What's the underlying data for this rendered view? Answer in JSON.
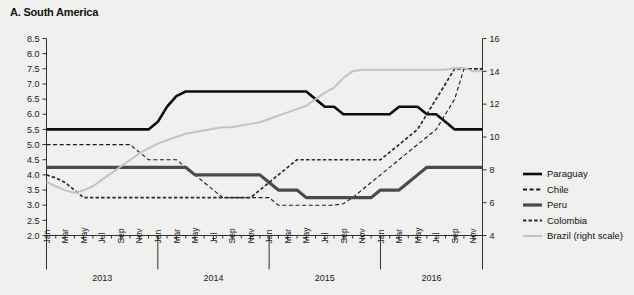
{
  "panel": {
    "title": "A. South America"
  },
  "chart_data": {
    "type": "line",
    "title": "A. South America",
    "xlabel": "",
    "ylabel": "",
    "y2label": "",
    "ylim": [
      2.0,
      8.5
    ],
    "y2lim": [
      4,
      16
    ],
    "grid": false,
    "legend_position": "right",
    "y_ticks": [
      "8.5",
      "8.0",
      "7.5",
      "7.0",
      "6.5",
      "6.0",
      "5.5",
      "5.0",
      "4.5",
      "4.0",
      "3.5",
      "3.0",
      "2.5",
      "2.0"
    ],
    "y2_ticks": [
      "16",
      "14",
      "12",
      "10",
      "8",
      "6",
      "4"
    ],
    "x_month_ticks": [
      "Jan",
      "Mar",
      "May",
      "Jul",
      "Sep",
      "Nov"
    ],
    "x_years": [
      "2013",
      "2014",
      "2015",
      "2016"
    ],
    "x": [
      "2013-01",
      "2013-02",
      "2013-03",
      "2013-04",
      "2013-05",
      "2013-06",
      "2013-07",
      "2013-08",
      "2013-09",
      "2013-10",
      "2013-11",
      "2013-12",
      "2014-01",
      "2014-02",
      "2014-03",
      "2014-04",
      "2014-05",
      "2014-06",
      "2014-07",
      "2014-08",
      "2014-09",
      "2014-10",
      "2014-11",
      "2014-12",
      "2015-01",
      "2015-02",
      "2015-03",
      "2015-04",
      "2015-05",
      "2015-06",
      "2015-07",
      "2015-08",
      "2015-09",
      "2015-10",
      "2015-11",
      "2015-12",
      "2016-01",
      "2016-02",
      "2016-03",
      "2016-04",
      "2016-05",
      "2016-06",
      "2016-07",
      "2016-08",
      "2016-09",
      "2016-10",
      "2016-11",
      "2016-12"
    ],
    "series": [
      {
        "name": "Paraguay",
        "axis": "left",
        "color": "#0d0d0d",
        "style": "solid",
        "width": 2.6,
        "values": [
          5.5,
          5.5,
          5.5,
          5.5,
          5.5,
          5.5,
          5.5,
          5.5,
          5.5,
          5.5,
          5.5,
          5.5,
          5.75,
          6.25,
          6.6,
          6.75,
          6.75,
          6.75,
          6.75,
          6.75,
          6.75,
          6.75,
          6.75,
          6.75,
          6.75,
          6.75,
          6.75,
          6.75,
          6.75,
          6.5,
          6.25,
          6.25,
          6.0,
          6.0,
          6.0,
          6.0,
          6.0,
          6.0,
          6.25,
          6.25,
          6.25,
          6.0,
          6.0,
          5.75,
          5.5,
          5.5,
          5.5,
          5.5
        ]
      },
      {
        "name": "Chile",
        "axis": "left",
        "color": "#1a1a1a",
        "style": "dashed",
        "width": 1.1,
        "values": [
          5.0,
          5.0,
          5.0,
          5.0,
          5.0,
          5.0,
          5.0,
          5.0,
          5.0,
          5.0,
          4.75,
          4.5,
          4.5,
          4.5,
          4.5,
          4.25,
          4.0,
          3.75,
          3.5,
          3.25,
          3.25,
          3.25,
          3.25,
          3.25,
          3.25,
          3.0,
          3.0,
          3.0,
          3.0,
          3.0,
          3.0,
          3.0,
          3.05,
          3.25,
          3.5,
          3.75,
          4.0,
          4.25,
          4.5,
          4.75,
          5.0,
          5.25,
          5.5,
          6.0,
          6.5,
          7.5,
          7.5,
          7.5
        ]
      },
      {
        "name": "Peru",
        "axis": "left",
        "color": "#4a4a4a",
        "style": "solid",
        "width": 3.2,
        "values": [
          4.25,
          4.25,
          4.25,
          4.25,
          4.25,
          4.25,
          4.25,
          4.25,
          4.25,
          4.25,
          4.25,
          4.25,
          4.25,
          4.25,
          4.25,
          4.25,
          4.0,
          4.0,
          4.0,
          4.0,
          4.0,
          4.0,
          4.0,
          4.0,
          3.75,
          3.5,
          3.5,
          3.5,
          3.25,
          3.25,
          3.25,
          3.25,
          3.25,
          3.25,
          3.25,
          3.25,
          3.5,
          3.5,
          3.5,
          3.75,
          4.0,
          4.25,
          4.25,
          4.25,
          4.25,
          4.25,
          4.25,
          4.25
        ]
      },
      {
        "name": "Colombia",
        "axis": "left",
        "color": "#2b2b2b",
        "style": "dashed-bold",
        "width": 1.7,
        "values": [
          4.0,
          3.9,
          3.75,
          3.5,
          3.25,
          3.25,
          3.25,
          3.25,
          3.25,
          3.25,
          3.25,
          3.25,
          3.25,
          3.25,
          3.25,
          3.25,
          3.25,
          3.25,
          3.25,
          3.25,
          3.25,
          3.25,
          3.25,
          3.5,
          3.75,
          4.0,
          4.25,
          4.5,
          4.5,
          4.5,
          4.5,
          4.5,
          4.5,
          4.5,
          4.5,
          4.5,
          4.5,
          4.75,
          5.0,
          5.25,
          5.5,
          6.0,
          6.5,
          7.0,
          7.5,
          7.5,
          7.5,
          7.5
        ]
      },
      {
        "name": "Brazil (right scale)",
        "axis": "right",
        "color": "#c3c3c3",
        "style": "solid",
        "width": 2.0,
        "values": [
          7.25,
          7.0,
          6.75,
          6.6,
          6.75,
          7.0,
          7.4,
          7.8,
          8.2,
          8.6,
          9.0,
          9.3,
          9.6,
          9.8,
          10.0,
          10.2,
          10.3,
          10.4,
          10.5,
          10.6,
          10.6,
          10.7,
          10.8,
          10.9,
          11.1,
          11.3,
          11.5,
          11.7,
          11.9,
          12.3,
          12.7,
          13.0,
          13.6,
          14.0,
          14.1,
          14.1,
          14.1,
          14.1,
          14.1,
          14.1,
          14.1,
          14.1,
          14.1,
          14.1,
          14.2,
          14.2,
          14.0,
          14.0
        ]
      }
    ]
  },
  "legend": {
    "items": [
      {
        "label": "Paraguay"
      },
      {
        "label": "Chile"
      },
      {
        "label": "Peru"
      },
      {
        "label": "Colombia"
      },
      {
        "label": "Brazil (right scale)"
      }
    ]
  }
}
